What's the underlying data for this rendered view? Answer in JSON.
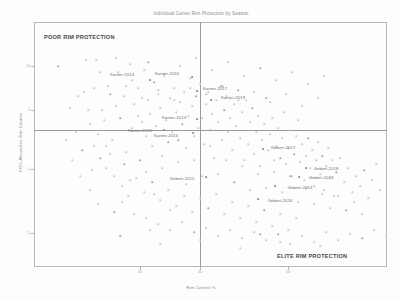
{
  "chart_data": {
    "type": "scatter",
    "title": "Individual Center Rim Protection by Season",
    "xlabel": "Rim Contest %",
    "ylabel": "FG% Allowed vs. Rim Contest",
    "xlim": [
      0,
      100
    ],
    "ylim": [
      0,
      100
    ],
    "grid": false,
    "legend": null,
    "reference_lines": {
      "vertical_x": 47,
      "horizontal_y": 56
    },
    "annotations": [
      {
        "text": "POOR RIM PROTECTION",
        "quadrant": "top-left"
      },
      {
        "text": "ELITE RIM PROTECTION",
        "quadrant": "bottom-right"
      }
    ],
    "xticks": [
      {
        "value": 30,
        "label": "30"
      },
      {
        "value": 47,
        "label": "40"
      },
      {
        "value": 72,
        "label": "50"
      }
    ],
    "yticks": [
      {
        "value": 82,
        "label": "10"
      },
      {
        "value": 64,
        "label": "5"
      },
      {
        "value": 40,
        "label": "0"
      },
      {
        "value": 14,
        "label": "-5"
      }
    ],
    "labeled_points": [
      {
        "label": "Kanter-2014",
        "x": 24.5,
        "y": 75.0,
        "lx": 122,
        "ly": 74,
        "px": 150,
        "py": 80
      },
      {
        "label": "Kanter-2016",
        "x": 33.0,
        "y": 76.0,
        "lx": 167,
        "ly": 73,
        "px": 192,
        "py": 77
      },
      {
        "label": "Kanter-2017",
        "x": 39.0,
        "y": 70.5,
        "lx": 215,
        "ly": 88,
        "px": 197,
        "py": 91
      },
      {
        "label": "Kanter-2019",
        "x": 44.0,
        "y": 67.0,
        "lx": 233,
        "ly": 97,
        "px": 211,
        "py": 100
      },
      {
        "label": "Kanter-2013",
        "x": 31.0,
        "y": 60.0,
        "lx": 174,
        "ly": 117,
        "px": 197,
        "py": 119
      },
      {
        "label": "Kanter-2015",
        "x": 25.0,
        "y": 56.5,
        "lx": 140,
        "ly": 130,
        "px": 164,
        "py": 130
      },
      {
        "label": "Kanter-2016b",
        "x": 30.0,
        "y": 55.5,
        "lx": 166,
        "ly": 135,
        "px": 193,
        "py": 133
      },
      {
        "label": "Gobert-2017",
        "x": 60.0,
        "y": 51.5,
        "lx": 283,
        "ly": 147,
        "px": 263,
        "py": 149
      },
      {
        "label": "Gobert-2018",
        "x": 70.0,
        "y": 45.0,
        "lx": 326,
        "ly": 168,
        "px": 306,
        "py": 168
      },
      {
        "label": "Gobert-2019",
        "x": 69.0,
        "y": 42.0,
        "lx": 321,
        "ly": 177,
        "px": 299,
        "py": 177
      },
      {
        "label": "Gobert-2014",
        "x": 63.0,
        "y": 38.0,
        "lx": 300,
        "ly": 187,
        "px": 275,
        "py": 186
      },
      {
        "label": "Gobert-2016",
        "x": 57.0,
        "y": 33.0,
        "lx": 280,
        "ly": 200,
        "px": 258,
        "py": 199
      },
      {
        "label": "Gobert-2015",
        "x": 33.0,
        "y": 39.0,
        "lx": 182,
        "ly": 178,
        "px": 206,
        "py": 177
      }
    ],
    "cloud_description": "Dense light-grey scatter cloud of individual center seasons, concentrated around the axis intersection, tapering toward the lower-right and upper-left.",
    "cloud_points": [
      [
        58,
        66
      ],
      [
        84,
        92
      ],
      [
        96,
        60
      ],
      [
        102,
        110
      ],
      [
        108,
        86
      ],
      [
        112,
        140
      ],
      [
        118,
        72
      ],
      [
        120,
        118
      ],
      [
        124,
        96
      ],
      [
        126,
        152
      ],
      [
        130,
        64
      ],
      [
        132,
        128
      ],
      [
        134,
        104
      ],
      [
        138,
        88
      ],
      [
        140,
        160
      ],
      [
        142,
        122
      ],
      [
        144,
        70
      ],
      [
        146,
        136
      ],
      [
        148,
        100
      ],
      [
        150,
        114
      ],
      [
        152,
        146
      ],
      [
        154,
        82
      ],
      [
        156,
        126
      ],
      [
        158,
        94
      ],
      [
        160,
        108
      ],
      [
        162,
        156
      ],
      [
        164,
        76
      ],
      [
        166,
        120
      ],
      [
        168,
        142
      ],
      [
        170,
        98
      ],
      [
        172,
        132
      ],
      [
        174,
        88
      ],
      [
        176,
        112
      ],
      [
        178,
        162
      ],
      [
        180,
        102
      ],
      [
        182,
        124
      ],
      [
        184,
        92
      ],
      [
        186,
        148
      ],
      [
        188,
        116
      ],
      [
        190,
        78
      ],
      [
        192,
        106
      ],
      [
        194,
        136
      ],
      [
        196,
        96
      ],
      [
        198,
        128
      ],
      [
        200,
        84
      ],
      [
        202,
        118
      ],
      [
        204,
        144
      ],
      [
        206,
        104
      ],
      [
        208,
        92
      ],
      [
        210,
        130
      ],
      [
        212,
        114
      ],
      [
        214,
        158
      ],
      [
        216,
        100
      ],
      [
        218,
        122
      ],
      [
        220,
        86
      ],
      [
        222,
        140
      ],
      [
        224,
        110
      ],
      [
        226,
        96
      ],
      [
        228,
        132
      ],
      [
        230,
        118
      ],
      [
        232,
        150
      ],
      [
        234,
        104
      ],
      [
        236,
        126
      ],
      [
        238,
        90
      ],
      [
        240,
        138
      ],
      [
        242,
        112
      ],
      [
        244,
        160
      ],
      [
        246,
        100
      ],
      [
        248,
        144
      ],
      [
        250,
        122
      ],
      [
        252,
        108
      ],
      [
        254,
        154
      ],
      [
        256,
        132
      ],
      [
        258,
        116
      ],
      [
        260,
        166
      ],
      [
        262,
        140
      ],
      [
        264,
        124
      ],
      [
        266,
        98
      ],
      [
        268,
        150
      ],
      [
        270,
        134
      ],
      [
        272,
        118
      ],
      [
        274,
        172
      ],
      [
        276,
        146
      ],
      [
        278,
        128
      ],
      [
        280,
        158
      ],
      [
        282,
        138
      ],
      [
        284,
        112
      ],
      [
        286,
        164
      ],
      [
        288,
        148
      ],
      [
        290,
        130
      ],
      [
        292,
        176
      ],
      [
        294,
        154
      ],
      [
        296,
        136
      ],
      [
        298,
        120
      ],
      [
        300,
        162
      ],
      [
        302,
        144
      ],
      [
        304,
        180
      ],
      [
        306,
        156
      ],
      [
        308,
        138
      ],
      [
        310,
        168
      ],
      [
        312,
        150
      ],
      [
        314,
        186
      ],
      [
        316,
        160
      ],
      [
        318,
        142
      ],
      [
        320,
        174
      ],
      [
        322,
        156
      ],
      [
        324,
        190
      ],
      [
        326,
        166
      ],
      [
        328,
        148
      ],
      [
        330,
        178
      ],
      [
        332,
        160
      ],
      [
        334,
        196
      ],
      [
        336,
        172
      ],
      [
        340,
        158
      ],
      [
        344,
        182
      ],
      [
        348,
        168
      ],
      [
        352,
        192
      ],
      [
        356,
        176
      ],
      [
        360,
        186
      ],
      [
        364,
        170
      ],
      [
        368,
        198
      ],
      [
        372,
        180
      ],
      [
        376,
        164
      ],
      [
        380,
        190
      ],
      [
        90,
        124
      ],
      [
        94,
        146
      ],
      [
        100,
        158
      ],
      [
        106,
        168
      ],
      [
        114,
        176
      ],
      [
        122,
        186
      ],
      [
        128,
        196
      ],
      [
        136,
        178
      ],
      [
        144,
        192
      ],
      [
        152,
        182
      ],
      [
        160,
        200
      ],
      [
        168,
        190
      ],
      [
        176,
        206
      ],
      [
        184,
        196
      ],
      [
        192,
        212
      ],
      [
        200,
        198
      ],
      [
        208,
        208
      ],
      [
        216,
        194
      ],
      [
        224,
        214
      ],
      [
        232,
        202
      ],
      [
        240,
        218
      ],
      [
        248,
        206
      ],
      [
        256,
        222
      ],
      [
        264,
        210
      ],
      [
        272,
        226
      ],
      [
        280,
        214
      ],
      [
        288,
        230
      ],
      [
        296,
        218
      ],
      [
        70,
        108
      ],
      [
        76,
        132
      ],
      [
        82,
        150
      ],
      [
        88,
        110
      ],
      [
        92,
        170
      ],
      [
        98,
        134
      ],
      [
        104,
        120
      ],
      [
        110,
        154
      ],
      [
        116,
        106
      ],
      [
        124,
        164
      ],
      [
        130,
        180
      ],
      [
        138,
        116
      ],
      [
        146,
        172
      ],
      [
        154,
        194
      ],
      [
        162,
        168
      ],
      [
        170,
        210
      ],
      [
        178,
        140
      ],
      [
        186,
        184
      ],
      [
        194,
        160
      ],
      [
        202,
        176
      ],
      [
        210,
        146
      ],
      [
        218,
        174
      ],
      [
        226,
        160
      ],
      [
        234,
        182
      ],
      [
        242,
        166
      ],
      [
        250,
        190
      ],
      [
        258,
        174
      ],
      [
        266,
        188
      ],
      [
        274,
        160
      ],
      [
        282,
        192
      ],
      [
        290,
        176
      ],
      [
        298,
        202
      ],
      [
        306,
        188
      ],
      [
        314,
        204
      ],
      [
        322,
        194
      ],
      [
        330,
        208
      ],
      [
        338,
        196
      ],
      [
        346,
        210
      ],
      [
        354,
        202
      ],
      [
        362,
        214
      ],
      [
        86,
        60
      ],
      [
        100,
        72
      ],
      [
        116,
        58
      ],
      [
        132,
        80
      ],
      [
        148,
        62
      ],
      [
        164,
        74
      ],
      [
        180,
        66
      ],
      [
        196,
        58
      ],
      [
        212,
        70
      ],
      [
        228,
        62
      ],
      [
        244,
        76
      ],
      [
        260,
        68
      ],
      [
        276,
        80
      ],
      [
        292,
        72
      ],
      [
        308,
        84
      ],
      [
        324,
        76
      ],
      [
        78,
        96
      ],
      [
        94,
        88
      ],
      [
        110,
        94
      ],
      [
        126,
        86
      ],
      [
        142,
        98
      ],
      [
        158,
        90
      ],
      [
        174,
        100
      ],
      [
        190,
        88
      ],
      [
        206,
        94
      ],
      [
        222,
        86
      ],
      [
        238,
        100
      ],
      [
        254,
        92
      ],
      [
        270,
        102
      ],
      [
        286,
        94
      ],
      [
        302,
        106
      ],
      [
        318,
        98
      ],
      [
        120,
        236
      ],
      [
        160,
        244
      ],
      [
        200,
        240
      ],
      [
        240,
        248
      ],
      [
        280,
        242
      ],
      [
        320,
        246
      ],
      [
        150,
        230
      ],
      [
        260,
        234
      ],
      [
        66,
        140
      ],
      [
        72,
        160
      ],
      [
        80,
        176
      ],
      [
        90,
        190
      ],
      [
        98,
        204
      ],
      [
        106,
        146
      ],
      [
        114,
        212
      ],
      [
        122,
        202
      ],
      [
        134,
        214
      ],
      [
        146,
        218
      ],
      [
        158,
        224
      ],
      [
        170,
        230
      ],
      [
        182,
        222
      ],
      [
        194,
        232
      ],
      [
        206,
        228
      ],
      [
        218,
        236
      ],
      [
        230,
        230
      ],
      [
        242,
        238
      ],
      [
        254,
        232
      ],
      [
        266,
        240
      ],
      [
        278,
        234
      ],
      [
        290,
        244
      ],
      [
        302,
        236
      ],
      [
        314,
        242
      ],
      [
        326,
        232
      ],
      [
        338,
        240
      ],
      [
        350,
        234
      ],
      [
        362,
        238
      ],
      [
        374,
        230
      ],
      [
        386,
        236
      ]
    ]
  }
}
